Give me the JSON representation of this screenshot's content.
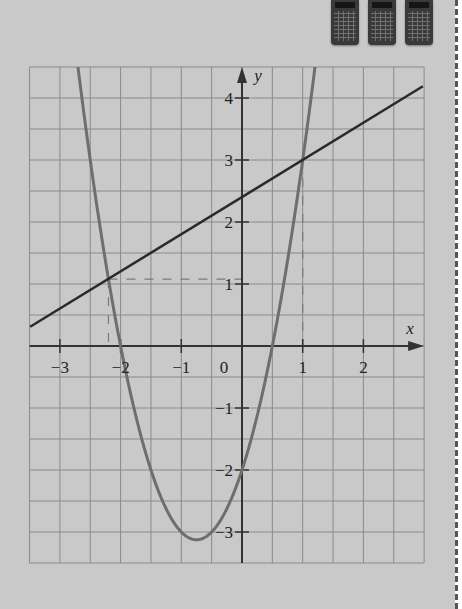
{
  "page": {
    "background_color": "#c9c9c9",
    "margin_rule": "dashed",
    "icons": [
      "calculator-icon",
      "calculator-icon",
      "calculator-icon"
    ]
  },
  "chart_data": {
    "type": "line",
    "title": "",
    "xlabel": "x",
    "ylabel": "y",
    "xlim": [
      -3.5,
      3.0
    ],
    "ylim": [
      -3.5,
      4.5
    ],
    "grid": true,
    "grid_step": 0.5,
    "x_ticks": [
      -3,
      -2,
      -1,
      1,
      2
    ],
    "x_tick_labels": [
      "−3",
      "−2",
      "−1",
      "1",
      "2"
    ],
    "y_ticks": [
      4,
      3,
      2,
      1,
      -1,
      -2,
      -3
    ],
    "y_tick_labels": [
      "4",
      "3",
      "2",
      "1",
      "−1",
      "−2",
      "−3"
    ],
    "origin_label": "0",
    "series": [
      {
        "name": "parabola",
        "equation": "y = 2x^2 + 3x - 2",
        "kind": "quadratic",
        "coefficients": {
          "a": 2,
          "b": 3,
          "c": -2
        },
        "color": "#6e6e6e",
        "vertex": [
          -0.75,
          -3.125
        ],
        "roots": [
          -2,
          0.5
        ],
        "y_intercept": -2
      },
      {
        "name": "straight line",
        "equation": "y = 0.6x + 2.4",
        "kind": "linear",
        "coefficients": {
          "m": 0.6,
          "c": 2.4
        },
        "color": "#2a2a2a",
        "points": [
          [
            -3.49,
            0.31
          ],
          [
            2.98,
            4.19
          ]
        ]
      }
    ],
    "intersections": [
      [
        -2.2,
        1.08
      ],
      [
        1,
        3
      ]
    ],
    "annotations": [
      {
        "type": "dashed-guide",
        "from": [
          -2.2,
          1.08
        ],
        "to": [
          0,
          1.08
        ],
        "note": "hand-drawn pencil"
      },
      {
        "type": "dashed-guide",
        "from": [
          -2.2,
          1.08
        ],
        "to": [
          -2.2,
          0
        ],
        "note": "hand-drawn pencil"
      },
      {
        "type": "dashed-guide",
        "from": [
          1,
          3
        ],
        "to": [
          1,
          0
        ],
        "note": "hand-drawn pencil"
      }
    ]
  }
}
